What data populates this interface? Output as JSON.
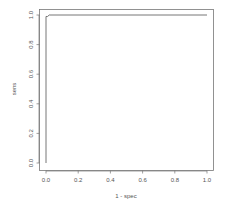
{
  "chart_data": {
    "type": "line",
    "title": "",
    "xlabel": "1 - spec",
    "ylabel": "sens",
    "xlim": [
      0.0,
      1.0
    ],
    "ylim": [
      0.0,
      1.0
    ],
    "grid": false,
    "legend": null,
    "xticks": [
      0.0,
      0.2,
      0.4,
      0.6,
      0.8,
      1.0
    ],
    "yticks": [
      0.0,
      0.2,
      0.4,
      0.6,
      0.8,
      1.0
    ],
    "xtick_labels": [
      "0.0",
      "0.2",
      "0.4",
      "0.6",
      "0.8",
      "1.0"
    ],
    "ytick_labels": [
      "0.0",
      "0.2",
      "0.4",
      "0.6",
      "0.8",
      "1.0"
    ],
    "series": [
      {
        "name": "ROC",
        "x": [
          0.0,
          0.0,
          0.01,
          0.02,
          1.0
        ],
        "y": [
          0.0,
          0.99,
          0.99,
          1.0,
          1.0
        ]
      }
    ]
  },
  "colors": {
    "line": "#666666",
    "axis": "#777777",
    "text": "#555555",
    "background": "#ffffff"
  }
}
